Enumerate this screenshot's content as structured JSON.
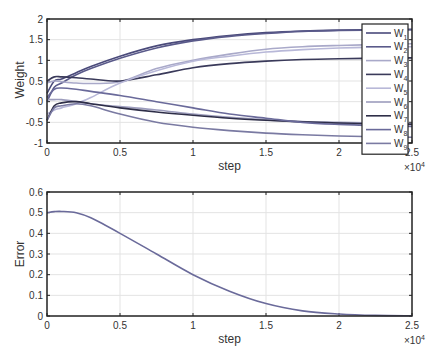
{
  "chart_data": [
    {
      "type": "line",
      "title": "",
      "xlabel": "step",
      "ylabel": "Weight",
      "x_exponent_label": "×10^4",
      "xlim": [
        0,
        2.5
      ],
      "ylim": [
        -1,
        2
      ],
      "grid": true,
      "legend_position": "top-right",
      "xticks": [
        "0",
        "0.5",
        "1",
        "1.5",
        "2",
        "2.5"
      ],
      "yticks": [
        "-1",
        "-0.5",
        "0",
        "0.5",
        "1",
        "1.5",
        "2"
      ],
      "x": [
        0,
        0.05,
        0.1,
        0.2,
        0.3,
        0.5,
        0.75,
        1.0,
        1.25,
        1.5,
        1.75,
        2.0,
        2.25,
        2.5
      ],
      "series": [
        {
          "name": "W1",
          "color": "#4a4a7a",
          "values": [
            0.2,
            0.5,
            0.55,
            0.7,
            0.85,
            1.1,
            1.35,
            1.5,
            1.6,
            1.67,
            1.71,
            1.73,
            1.74,
            1.75
          ]
        },
        {
          "name": "W2",
          "color": "#5a5a8a",
          "values": [
            0.0,
            0.35,
            0.45,
            0.65,
            0.8,
            1.05,
            1.3,
            1.47,
            1.58,
            1.65,
            1.7,
            1.72,
            1.73,
            1.74
          ]
        },
        {
          "name": "W3",
          "color": "#a9a9c9",
          "values": [
            0.45,
            0.5,
            0.48,
            0.45,
            0.44,
            0.48,
            0.8,
            1.0,
            1.15,
            1.27,
            1.33,
            1.36,
            1.38,
            1.4
          ]
        },
        {
          "name": "W4",
          "color": "#3a3a5a",
          "values": [
            0.5,
            0.6,
            0.6,
            0.58,
            0.55,
            0.5,
            0.65,
            0.82,
            0.92,
            0.98,
            1.02,
            1.04,
            1.05,
            1.06
          ]
        },
        {
          "name": "W5",
          "color": "#b8b8d8",
          "values": [
            -0.3,
            -0.2,
            -0.15,
            -0.05,
            0.1,
            0.45,
            0.75,
            0.98,
            1.1,
            1.2,
            1.26,
            1.3,
            1.32,
            1.33
          ]
        },
        {
          "name": "W6",
          "color": "#9d9dbd",
          "values": [
            0.05,
            0.05,
            0.05,
            0.0,
            -0.05,
            -0.12,
            -0.2,
            -0.3,
            -0.38,
            -0.44,
            -0.48,
            -0.5,
            -0.52,
            -0.53
          ]
        },
        {
          "name": "W7",
          "color": "#2e2e48",
          "values": [
            -0.45,
            -0.1,
            -0.03,
            0.0,
            -0.05,
            -0.15,
            -0.25,
            -0.33,
            -0.4,
            -0.45,
            -0.49,
            -0.52,
            -0.54,
            -0.55
          ]
        },
        {
          "name": "W8",
          "color": "#6a6a9a",
          "values": [
            0.1,
            0.3,
            0.33,
            0.3,
            0.25,
            0.15,
            0.0,
            -0.15,
            -0.3,
            -0.4,
            -0.5,
            -0.55,
            -0.58,
            -0.6
          ]
        },
        {
          "name": "W9",
          "color": "#7a7aa2",
          "values": [
            -0.45,
            -0.15,
            -0.1,
            -0.05,
            -0.1,
            -0.3,
            -0.5,
            -0.62,
            -0.7,
            -0.76,
            -0.8,
            -0.83,
            -0.85,
            -0.86
          ]
        }
      ]
    },
    {
      "type": "line",
      "title": "",
      "xlabel": "step",
      "ylabel": "Error",
      "x_exponent_label": "×10^4",
      "xlim": [
        0,
        2.5
      ],
      "ylim": [
        0,
        0.6
      ],
      "grid": true,
      "xticks": [
        "0",
        "0.5",
        "1",
        "1.5",
        "2",
        "2.5"
      ],
      "yticks": [
        "0",
        "0.1",
        "0.2",
        "0.3",
        "0.4",
        "0.5",
        "0.6"
      ],
      "x": [
        0,
        0.05,
        0.1,
        0.2,
        0.3,
        0.5,
        0.75,
        1.0,
        1.25,
        1.5,
        1.75,
        2.0,
        2.25,
        2.5
      ],
      "series": [
        {
          "name": "Error",
          "color": "#6a6a9a",
          "values": [
            0.5,
            0.505,
            0.506,
            0.5,
            0.475,
            0.4,
            0.3,
            0.2,
            0.12,
            0.06,
            0.025,
            0.01,
            0.003,
            0.001
          ]
        }
      ]
    }
  ]
}
